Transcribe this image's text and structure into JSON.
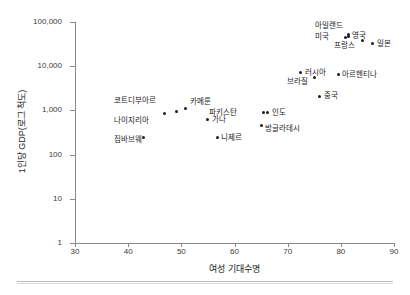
{
  "chart_data": {
    "type": "scatter",
    "title": "",
    "xlabel": "여성 기대수명",
    "ylabel": "1인당 GDP(로그 척도)",
    "xlim": [
      30,
      90
    ],
    "ylim": [
      1,
      100000
    ],
    "yscale": "log",
    "grid": false,
    "legend": "none",
    "xticks": [
      "30",
      "40",
      "50",
      "60",
      "70",
      "80",
      "90"
    ],
    "yticks": [
      "1",
      "10",
      "100",
      "1,000",
      "10,000",
      "100,000"
    ],
    "points": [
      {
        "label": "짐바브웨",
        "x": 42.8,
        "y": 250,
        "lx": -1,
        "ly": 3
      },
      {
        "label": "나이지리아",
        "x": 46.8,
        "y": 850,
        "lx": -15,
        "ly": 7
      },
      {
        "label": "코트디부아르",
        "x": 49.0,
        "y": 950,
        "lx": -20,
        "ly": -10
      },
      {
        "label": "카메룬",
        "x": 50.8,
        "y": 1100,
        "lx": 4,
        "ly": -7
      },
      {
        "label": "가나",
        "x": 55.0,
        "y": 620,
        "lx": 4,
        "ly": 0
      },
      {
        "label": "니제르",
        "x": 56.8,
        "y": 240,
        "lx": 4,
        "ly": 0
      },
      {
        "label": "방글라데시",
        "x": 65.0,
        "y": 450,
        "lx": 4,
        "ly": 3
      },
      {
        "label": "파키스탄",
        "x": 65.5,
        "y": 880,
        "lx": -27,
        "ly": 0
      },
      {
        "label": "인도",
        "x": 66.3,
        "y": 880,
        "lx": 4,
        "ly": 0
      },
      {
        "label": "러시아",
        "x": 72.5,
        "y": 7200,
        "lx": 4,
        "ly": 0
      },
      {
        "label": "브라질",
        "x": 75.0,
        "y": 5600,
        "lx": -6,
        "ly": 5
      },
      {
        "label": "중국",
        "x": 76.0,
        "y": 2100,
        "lx": 4,
        "ly": 0
      },
      {
        "label": "아르헨티나",
        "x": 79.5,
        "y": 6400,
        "lx": 4,
        "ly": 0
      },
      {
        "label": "미국",
        "x": 80.8,
        "y": 45000,
        "lx": -16,
        "ly": 0
      },
      {
        "label": "영국",
        "x": 81.5,
        "y": 47000,
        "lx": 3,
        "ly": 0
      },
      {
        "label": "아일랜드",
        "x": 81.5,
        "y": 52000,
        "lx": -6,
        "ly": -9
      },
      {
        "label": "프랑스",
        "x": 84.0,
        "y": 38000,
        "lx": -7,
        "ly": 5
      },
      {
        "label": "일본",
        "x": 86.0,
        "y": 33000,
        "lx": 4,
        "ly": 1
      }
    ]
  }
}
